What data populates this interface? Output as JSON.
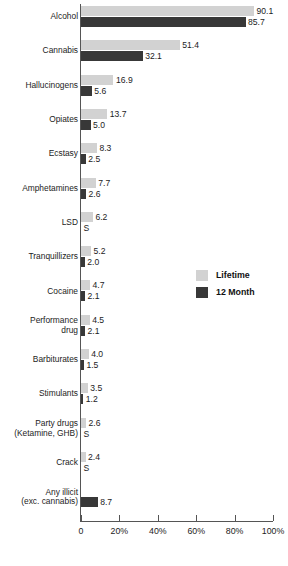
{
  "chart_data": {
    "type": "bar",
    "title": "",
    "subtitle": "",
    "xlabel": "",
    "ylabel": "",
    "orientation": "horizontal",
    "grid": false,
    "legend_position": "middle-right",
    "xlim": [
      0,
      100
    ],
    "xticks": [
      0,
      20,
      40,
      60,
      80,
      100
    ],
    "xtick_labels": [
      "0",
      "20%",
      "40%",
      "60%",
      "80%",
      "100%"
    ],
    "suppressed_marker": "S",
    "categories": [
      "Alcohol",
      "Cannabis",
      "Hallucinogens",
      "Opiates",
      "Ecstasy",
      "Amphetamines",
      "LSD",
      "Tranquillizers",
      "Cocaine",
      "Performance\ndrug",
      "Barbiturates",
      "Stimulants",
      "Party drugs\n(Ketamine, GHB)",
      "Crack",
      "Any illicit\n(exc. cannabis)"
    ],
    "series": [
      {
        "name": "Lifetime",
        "color": "#d2d2d2",
        "values": [
          90.1,
          51.4,
          16.9,
          13.7,
          8.3,
          7.7,
          6.2,
          5.2,
          4.7,
          4.5,
          4.0,
          3.5,
          2.6,
          2.4,
          null
        ],
        "labels": [
          "90.1",
          "51.4",
          "16.9",
          "13.7",
          "8.3",
          "7.7",
          "6.2",
          "5.2",
          "4.7",
          "4.5",
          "4.0",
          "3.5",
          "2.6",
          "2.4",
          ""
        ]
      },
      {
        "name": "12 Month",
        "color": "#383838",
        "values": [
          85.7,
          32.1,
          5.6,
          5.0,
          2.5,
          2.6,
          null,
          2.0,
          2.1,
          2.1,
          1.5,
          1.2,
          null,
          null,
          8.7
        ],
        "labels": [
          "85.7",
          "32.1",
          "5.6",
          "5.0",
          "2.5",
          "2.6",
          "S",
          "2.0",
          "2.1",
          "2.1",
          "1.5",
          "1.2",
          "S",
          "S",
          "8.7"
        ]
      }
    ]
  },
  "legend": {
    "items": [
      {
        "label": "Lifetime",
        "color": "#d2d2d2"
      },
      {
        "label": "12 Month",
        "color": "#383838"
      }
    ]
  }
}
